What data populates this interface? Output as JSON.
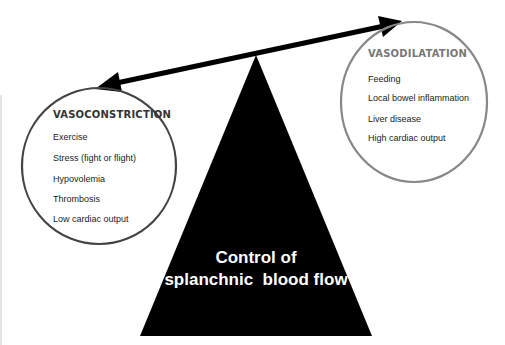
{
  "diagram": {
    "type": "balance-scale",
    "center": {
      "line1": "Control of",
      "line2": "splanchnic  blood flow"
    },
    "left": {
      "title": "VASOCONSTRICTION",
      "items": [
        "Exercise",
        "Stress (fight or flight)",
        "Hypovolemia",
        "Thrombosis",
        "Low cardiac output"
      ],
      "border_color": "#444444"
    },
    "right": {
      "title": "VASODILATATION",
      "items": [
        "Feeding",
        "Local bowel inflammation",
        "Liver disease",
        "High cardiac output"
      ],
      "border_color": "#888888"
    },
    "colors": {
      "fulcrum": "#000000",
      "beam": "#000000",
      "center_text": "#ffffff"
    }
  }
}
